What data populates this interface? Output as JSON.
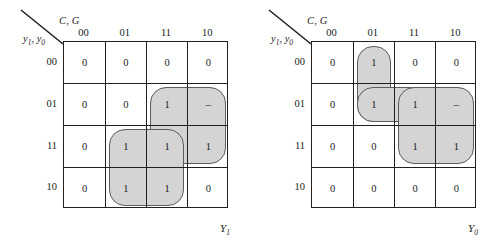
{
  "maps": [
    {
      "name": "Y1",
      "col_vars": "C, G",
      "row_vars": "y1, y0",
      "row_vars_base": "y",
      "col_headers": [
        "00",
        "01",
        "11",
        "10"
      ],
      "row_headers": [
        "00",
        "01",
        "11",
        "10"
      ],
      "output_label": "Y",
      "output_sub": "1",
      "cells": [
        [
          "0",
          "0",
          "0",
          "0"
        ],
        [
          "0",
          "0",
          "1",
          "–"
        ],
        [
          "0",
          "1",
          "1",
          "1"
        ],
        [
          "0",
          "1",
          "1",
          "0"
        ]
      ],
      "groups": [
        {
          "name": "group-rows-01-11-cols-11-10",
          "row": 1,
          "col": 2,
          "rows": 2,
          "cols": 2
        },
        {
          "name": "group-rows-11-10-cols-01-11",
          "row": 2,
          "col": 1,
          "rows": 2,
          "cols": 2
        }
      ]
    },
    {
      "name": "Y0",
      "col_vars": "C, G",
      "row_vars": "y1, y0",
      "row_vars_base": "y",
      "col_headers": [
        "00",
        "01",
        "11",
        "10"
      ],
      "row_headers": [
        "00",
        "01",
        "11",
        "10"
      ],
      "output_label": "Y",
      "output_sub": "0",
      "cells": [
        [
          "0",
          "1",
          "0",
          "0"
        ],
        [
          "0",
          "1",
          "1",
          "–"
        ],
        [
          "0",
          "0",
          "1",
          "1"
        ],
        [
          "0",
          "0",
          "0",
          "0"
        ]
      ],
      "groups": [
        {
          "name": "group-rows-00-01-col-01",
          "row": 0,
          "col": 1,
          "rows": 2,
          "cols": 1
        },
        {
          "name": "group-row-01-cols-01-11",
          "row": 1,
          "col": 1,
          "rows": 1,
          "cols": 2
        },
        {
          "name": "group-rows-01-11-cols-11-10",
          "row": 1,
          "col": 2,
          "rows": 2,
          "cols": 2
        }
      ]
    }
  ],
  "colors": {
    "group_fill": "#d4d4d4",
    "group_stroke": "#5d5d5d",
    "grid_line": "#231f20",
    "background": "#ffffff"
  }
}
